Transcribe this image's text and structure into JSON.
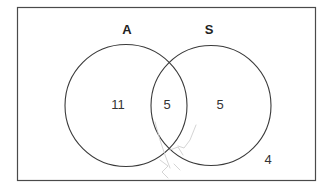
{
  "diagram": {
    "type": "venn",
    "universal_set": {
      "outside_count": "4"
    },
    "sets": [
      {
        "name": "A",
        "label": "A",
        "only_count": "11"
      },
      {
        "name": "S",
        "label": "S",
        "only_count": "5"
      }
    ],
    "intersection": {
      "sets": [
        "A",
        "S"
      ],
      "count": "5"
    },
    "colors": {
      "stroke": "#3a3a3a",
      "text": "#222222",
      "sketch_marks": "#c8c8c8",
      "background": "#ffffff"
    }
  }
}
